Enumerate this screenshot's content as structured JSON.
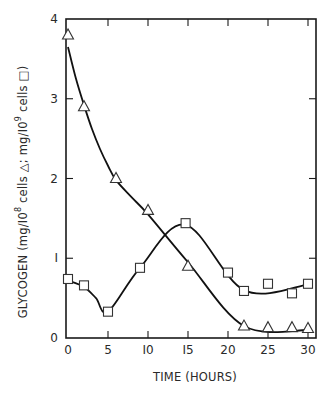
{
  "chart_data": {
    "type": "line",
    "title": "",
    "xlabel": "TIME (HOURS)",
    "ylabel": {
      "prefix": "GLYCOGEN  (mg/I0",
      "sup1": "8",
      "mid": " cells △; mg/I0",
      "sup2": "9",
      "suffix": " cells □)"
    },
    "xlim": [
      -0.25,
      31
    ],
    "ylim": [
      0,
      4
    ],
    "xticks": [
      0,
      5,
      10,
      15,
      20,
      25,
      30
    ],
    "xtick_labels": [
      "0",
      "5",
      "I0",
      "I5",
      "20",
      "25",
      "30"
    ],
    "yticks": [
      0,
      1,
      2,
      3,
      4
    ],
    "ytick_labels": [
      "0",
      "I",
      "2",
      "3",
      "4"
    ],
    "grid": false,
    "legend": "none (markers explained in y-axis label)",
    "series": [
      {
        "name": "mg/10^8 cells",
        "marker": "triangle",
        "x": [
          0,
          2,
          6,
          10,
          15,
          22,
          25,
          28,
          30
        ],
        "y": [
          3.8,
          2.9,
          2.0,
          1.6,
          0.9,
          0.15,
          0.13,
          0.13,
          0.12
        ]
      },
      {
        "name": "mg/10^9 cells",
        "marker": "square",
        "x": [
          0,
          2,
          5,
          9,
          14.7,
          20,
          22,
          25,
          28,
          30
        ],
        "y": [
          0.74,
          0.66,
          0.33,
          0.88,
          1.44,
          0.82,
          0.59,
          0.68,
          0.56,
          0.68
        ]
      }
    ],
    "fit_lines": [
      {
        "series": "mg/10^8 cells",
        "x": [
          0,
          1,
          2,
          3,
          4,
          5,
          6,
          8,
          10,
          15,
          22,
          30
        ],
        "y": [
          3.65,
          3.25,
          2.92,
          2.62,
          2.37,
          2.16,
          1.98,
          1.76,
          1.55,
          0.95,
          0.15,
          0.1
        ]
      },
      {
        "series": "mg/10^9 cells",
        "x": [
          0,
          2,
          3.5,
          5,
          9,
          14.7,
          22,
          30
        ],
        "y": [
          0.72,
          0.64,
          0.5,
          0.33,
          0.88,
          1.42,
          0.6,
          0.67
        ]
      }
    ]
  }
}
